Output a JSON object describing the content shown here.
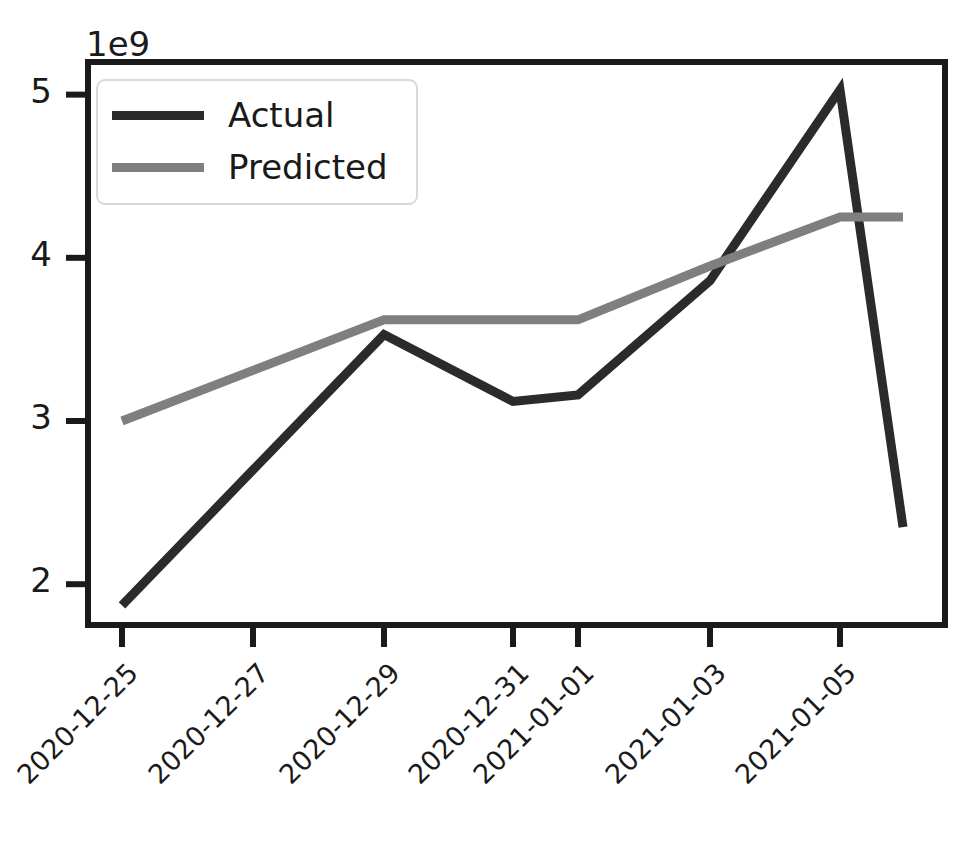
{
  "chart_data": {
    "type": "line",
    "title": "",
    "xlabel": "",
    "ylabel": "",
    "y_offset_label": "1e9",
    "y_tick_labels": [
      "5",
      "4",
      "3",
      "2"
    ],
    "y_tick_values": [
      5000000000,
      4000000000,
      3000000000,
      2000000000
    ],
    "ylim": [
      1750000000,
      5200000000
    ],
    "grid": false,
    "legend_position": "upper left",
    "categories": [
      "2020-12-25",
      "2020-12-26",
      "2020-12-27",
      "2020-12-29",
      "2020-12-31",
      "2021-01-01",
      "2021-01-03",
      "2021-01-05"
    ],
    "x_tick_labels": [
      "2020-12-25",
      "2020-12-27",
      "2020-12-29",
      "2020-12-31",
      "2021-01-01",
      "2021-01-03",
      "2021-01-05"
    ],
    "series": [
      {
        "name": "Actual",
        "color": "#2b2b2b",
        "values": [
          1870000000,
          2700000000,
          3530000000,
          3120000000,
          3160000000,
          3860000000,
          5030000000,
          2350000000
        ]
      },
      {
        "name": "Predicted",
        "color": "#7f7f7f",
        "values": [
          3000000000,
          3310000000,
          3620000000,
          3620000000,
          3620000000,
          3950000000,
          4250000000,
          4250000000
        ]
      }
    ]
  },
  "legend": {
    "items": [
      {
        "label": "Actual",
        "color": "#2b2b2b"
      },
      {
        "label": "Predicted",
        "color": "#7f7f7f"
      }
    ]
  },
  "axes": {
    "spine_color": "#1a1a1a",
    "text_color": "#1a1a1a",
    "background": "#ffffff"
  }
}
